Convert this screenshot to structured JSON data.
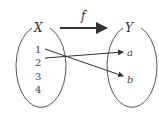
{
  "diagram": {
    "type": "function-mapping",
    "function_label": "f",
    "domain": {
      "label": "X",
      "elements": [
        "1",
        "2",
        "3",
        "4"
      ]
    },
    "codomain": {
      "label": "Y",
      "elements": [
        "a",
        "b"
      ]
    },
    "mappings": [
      {
        "from": "1",
        "to": "b"
      },
      {
        "from": "2",
        "to": "a"
      }
    ],
    "colors": {
      "stroke": "#333333",
      "background": "#ffffff"
    }
  }
}
